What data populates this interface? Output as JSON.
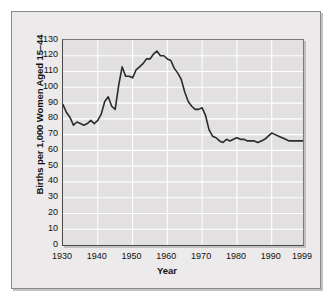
{
  "chart_data": {
    "type": "line",
    "title": "",
    "xlabel": "Year",
    "ylabel": "Births per 1,000 Women Aged 15–44",
    "xlim": [
      1930,
      1999
    ],
    "ylim": [
      0,
      130
    ],
    "grid": true,
    "legend": false,
    "y_ticks": [
      130,
      120,
      110,
      100,
      90,
      80,
      70,
      60,
      50,
      40,
      30,
      20,
      10,
      0
    ],
    "x_ticks": [
      1930,
      1940,
      1950,
      1960,
      1970,
      1980,
      1990,
      1999
    ],
    "x_tick_labels": [
      "1930",
      "1940",
      "1950",
      "1960",
      "1970",
      "1980",
      "1990",
      "1999"
    ],
    "line_color": "#2b2b2b",
    "panel_color": "#e2e0e0",
    "grid_color": "#ffffff",
    "series": [
      {
        "name": "Births per 1,000 Women Aged 15-44",
        "x": [
          1930,
          1931,
          1932,
          1933,
          1934,
          1935,
          1936,
          1937,
          1938,
          1939,
          1940,
          1941,
          1942,
          1943,
          1944,
          1945,
          1946,
          1947,
          1948,
          1949,
          1950,
          1951,
          1952,
          1953,
          1954,
          1955,
          1956,
          1957,
          1958,
          1959,
          1960,
          1961,
          1962,
          1963,
          1964,
          1965,
          1966,
          1967,
          1968,
          1969,
          1970,
          1971,
          1972,
          1973,
          1974,
          1975,
          1976,
          1977,
          1978,
          1979,
          1980,
          1981,
          1982,
          1983,
          1984,
          1985,
          1986,
          1987,
          1988,
          1989,
          1990,
          1991,
          1992,
          1993,
          1994,
          1995,
          1996,
          1997,
          1998,
          1999
        ],
        "values": [
          89,
          84,
          81,
          76,
          78,
          77,
          76,
          77,
          79,
          77,
          79,
          83,
          91,
          94,
          88,
          86,
          101,
          113,
          107,
          107,
          106,
          111,
          113,
          115,
          118,
          118,
          121,
          123,
          120,
          120,
          118,
          117,
          112,
          109,
          105,
          97,
          91,
          88,
          86,
          86,
          87,
          82,
          73,
          69,
          68,
          66,
          65,
          67,
          66,
          67,
          68,
          67,
          67,
          66,
          66,
          66,
          65,
          66,
          67,
          69,
          71,
          70,
          69,
          68,
          67,
          66,
          66,
          66,
          66,
          66
        ]
      }
    ]
  },
  "axis": {
    "y_title": "Births per 1,000 Women Aged 15–44",
    "x_title": "Year"
  }
}
